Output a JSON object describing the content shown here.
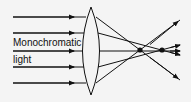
{
  "diagram": {
    "labels": {
      "line1": "Monochromatic",
      "line2": "light"
    },
    "colors": {
      "background": "#f4f4f4",
      "stroke": "#111111"
    },
    "elements": [
      "incoming parallel rays (5)",
      "biconvex lens",
      "marginal focus point",
      "paraxial focus point",
      "diverging rays"
    ]
  }
}
